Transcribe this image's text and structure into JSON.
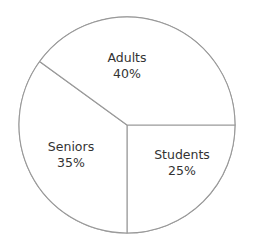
{
  "title": "Museum Patrons",
  "colors": {
    "background": "#ffffff",
    "stroke": "#999999",
    "slice_fill": "#ffffff",
    "label_text": "#333333",
    "title_text": "#3a3a3a"
  },
  "chart_data": {
    "type": "pie",
    "title": "Museum Patrons",
    "xlabel": "",
    "ylabel": "",
    "categories": [
      "Adults",
      "Seniors",
      "Students"
    ],
    "values": [
      40,
      35,
      25
    ],
    "unit": "%",
    "legend": "none",
    "grid": false,
    "start_angle_deg": 0,
    "direction": "clockwise",
    "geometry": {
      "center_x": 127,
      "center_y": 125,
      "radius": 108
    },
    "slices": [
      {
        "label": "Adults",
        "value": 40,
        "value_text": "40%",
        "start_deg": 216,
        "end_deg": 360,
        "fill": "#ffffff",
        "stroke": "#999999"
      },
      {
        "label": "Seniors",
        "value": 35,
        "value_text": "35%",
        "start_deg": 90,
        "end_deg": 216,
        "fill": "#ffffff",
        "stroke": "#999999"
      },
      {
        "label": "Students",
        "value": 25,
        "value_text": "25%",
        "start_deg": 0,
        "end_deg": 90,
        "fill": "#ffffff",
        "stroke": "#999999"
      }
    ]
  },
  "labels": {
    "adults": {
      "name": "Adults",
      "pct": "40%"
    },
    "seniors": {
      "name": "Seniors",
      "pct": "35%"
    },
    "students": {
      "name": "Students",
      "pct": "25%"
    }
  }
}
